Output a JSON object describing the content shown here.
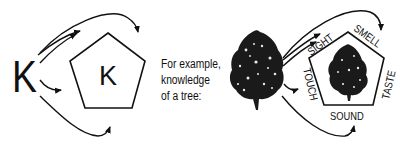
{
  "diagram": {
    "left": {
      "outer_letter": "K",
      "inner_letter": "K",
      "shape": "pentagon",
      "arrow_count": 5
    },
    "caption": {
      "lines": [
        "For example,",
        "knowledge",
        "of a tree:"
      ]
    },
    "right": {
      "outer_object": "tree",
      "inner_object": "tree",
      "shape": "pentagon",
      "senses": {
        "top_left": "SIGHT",
        "top_right": "SMELL",
        "right": "TASTE",
        "bottom": "SOUND",
        "left": "TOUCH"
      },
      "arrow_count": 5
    },
    "colors": {
      "ink": "#111111",
      "background": "#ffffff"
    }
  }
}
